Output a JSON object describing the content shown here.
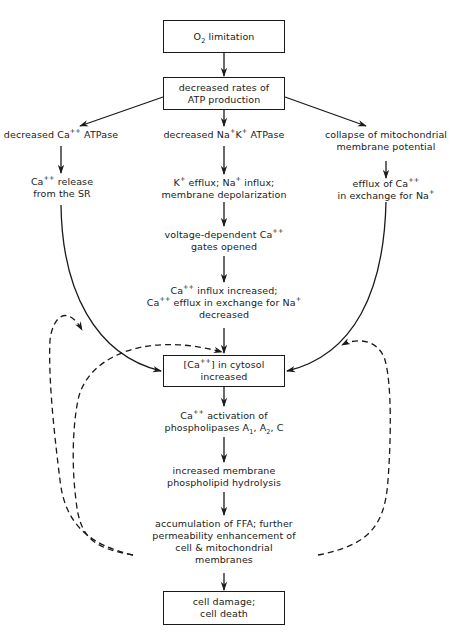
{
  "diagram": {
    "type": "flowchart",
    "title": "",
    "nodes": {
      "o2_limitation": {
        "lines": [
          "O2 limitation"
        ],
        "boxed": true
      },
      "atp_production": {
        "lines": [
          "decreased rates of",
          "ATP production"
        ],
        "boxed": true
      },
      "ca_atpase": {
        "lines": [
          "decreased Ca++ ATPase"
        ],
        "boxed": false
      },
      "na_k_atpase": {
        "lines": [
          "decreased Na+K+ ATPase"
        ],
        "boxed": false
      },
      "mito_collapse": {
        "lines": [
          "collapse of mitochondrial",
          "membrane potential"
        ],
        "boxed": false
      },
      "ca_release_sr": {
        "lines": [
          "Ca++ release",
          "from the SR"
        ],
        "boxed": false
      },
      "k_efflux": {
        "lines": [
          "K+ efflux; Na+ influx;",
          "membrane depolarization"
        ],
        "boxed": false
      },
      "ca_efflux_exchange": {
        "lines": [
          "efflux of Ca++",
          "in exchange for Na+"
        ],
        "boxed": false
      },
      "voltage_gates": {
        "lines": [
          "voltage-dependent Ca++",
          "gates opened"
        ],
        "boxed": false
      },
      "ca_influx": {
        "lines": [
          "Ca++ influx increased;",
          "Ca++ efflux in exchange for Na+",
          "decreased"
        ],
        "boxed": false
      },
      "cytosol_ca": {
        "lines": [
          "[Ca++] in cytosol",
          "increased"
        ],
        "boxed": true
      },
      "phospholipases": {
        "lines": [
          "Ca++ activation of",
          "phospholipases A1, A2, C"
        ],
        "boxed": false
      },
      "hydrolysis": {
        "lines": [
          "increased membrane",
          "phospholipid hydrolysis"
        ],
        "boxed": false
      },
      "ffa": {
        "lines": [
          "accumulation of FFA; further",
          "permeability enhancement of",
          "cell & mitochondrial",
          "membranes"
        ],
        "boxed": false
      },
      "cell_death": {
        "lines": [
          "cell damage;",
          "cell death"
        ],
        "boxed": true
      }
    },
    "text": {
      "o2_a": "O",
      "o2_sub": "2",
      "o2_b": " limitation",
      "atp_1": "decreased rates of",
      "atp_2": "ATP production",
      "caatp_a": "decreased Ca",
      "caatp_sup": "++",
      "caatp_b": " ATPase",
      "nak_a": "decreased Na",
      "nak_sup1": "+",
      "nak_b": "K",
      "nak_sup2": "+",
      "nak_c": " ATPase",
      "mito_1": "collapse of mitochondrial",
      "mito_2": "membrane potential",
      "sr_a": "Ca",
      "sr_sup": "++",
      "sr_b": " release",
      "sr_2": "from the SR",
      "kef_a": "K",
      "kef_sup1": "+",
      "kef_b": " efflux; Na",
      "kef_sup2": "+",
      "kef_c": " influx;",
      "kef_2": "membrane depolarization",
      "cae_a": "efflux of Ca",
      "cae_sup1": "++",
      "cae_b": "in exchange for Na",
      "cae_sup2": "+",
      "vg_a": "voltage-dependent Ca",
      "vg_sup": "++",
      "vg_2": "gates opened",
      "ci_a": "Ca",
      "ci_sup1": "++",
      "ci_b": " influx increased;",
      "ci_c": "Ca",
      "ci_sup2": "++",
      "ci_d": " efflux in exchange for Na",
      "ci_sup3": "+",
      "ci_3": "decreased",
      "cy_a": "[Ca",
      "cy_sup": "++",
      "cy_b": "] in cytosol",
      "cy_2": "increased",
      "pl_a": "Ca",
      "pl_sup": "++",
      "pl_b": " activation of",
      "pl_c": "phospholipases A",
      "pl_sub1": "1",
      "pl_d": ", A",
      "pl_sub2": "2",
      "pl_e": ", C",
      "hy_1": "increased membrane",
      "hy_2": "phospholipid hydrolysis",
      "ffa_1": "accumulation of FFA; further",
      "ffa_2": "permeability enhancement of",
      "ffa_3": "cell & mitochondrial",
      "ffa_4": "membranes",
      "cd_1": "cell damage;",
      "cd_2": "cell death"
    },
    "edges": [
      {
        "from": "o2_limitation",
        "to": "atp_production",
        "style": "solid"
      },
      {
        "from": "atp_production",
        "to": "ca_atpase",
        "style": "solid"
      },
      {
        "from": "atp_production",
        "to": "na_k_atpase",
        "style": "solid"
      },
      {
        "from": "atp_production",
        "to": "mito_collapse",
        "style": "solid"
      },
      {
        "from": "ca_atpase",
        "to": "ca_release_sr",
        "style": "solid"
      },
      {
        "from": "na_k_atpase",
        "to": "k_efflux",
        "style": "solid"
      },
      {
        "from": "mito_collapse",
        "to": "ca_efflux_exchange",
        "style": "solid"
      },
      {
        "from": "k_efflux",
        "to": "voltage_gates",
        "style": "solid"
      },
      {
        "from": "voltage_gates",
        "to": "ca_influx",
        "style": "solid"
      },
      {
        "from": "ca_release_sr",
        "to": "cytosol_ca",
        "style": "solid-curve"
      },
      {
        "from": "ca_influx",
        "to": "cytosol_ca",
        "style": "solid"
      },
      {
        "from": "ca_efflux_exchange",
        "to": "cytosol_ca",
        "style": "solid-curve"
      },
      {
        "from": "cytosol_ca",
        "to": "phospholipases",
        "style": "solid"
      },
      {
        "from": "phospholipases",
        "to": "hydrolysis",
        "style": "solid"
      },
      {
        "from": "hydrolysis",
        "to": "ffa",
        "style": "solid"
      },
      {
        "from": "ffa",
        "to": "cell_death",
        "style": "solid"
      },
      {
        "from": "ffa",
        "to": "cytosol_ca",
        "style": "dashed-feedback-left"
      },
      {
        "from": "ffa",
        "to": "ca_release_sr",
        "style": "dashed-feedback-left"
      },
      {
        "from": "ffa",
        "to": "ca_efflux_exchange",
        "style": "dashed-feedback-right"
      }
    ],
    "colors": {
      "ink": "#1a1a1a",
      "background": "#ffffff"
    }
  }
}
